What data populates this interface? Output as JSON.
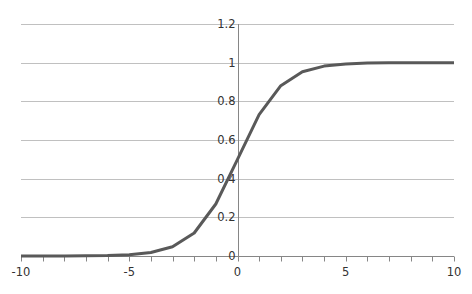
{
  "chart_data": {
    "type": "line",
    "title": "",
    "xlabel": "",
    "ylabel": "",
    "x": [
      -10,
      -9,
      -8,
      -7,
      -6,
      -5,
      -4,
      -3,
      -2,
      -1,
      0,
      1,
      2,
      3,
      4,
      5,
      6,
      7,
      8,
      9,
      10
    ],
    "series": [
      {
        "name": "sigmoid",
        "values": [
          4.54e-05,
          0.000123,
          0.000335,
          0.000911,
          0.00247,
          0.00669,
          0.018,
          0.0474,
          0.1192,
          0.2689,
          0.5,
          0.7311,
          0.8808,
          0.9526,
          0.982,
          0.9933,
          0.9975,
          0.9991,
          0.9997,
          0.9999,
          1.0
        ]
      }
    ],
    "xlim": [
      -10,
      10
    ],
    "ylim": [
      0,
      1.2
    ],
    "x_ticks": [
      "-10",
      "-5",
      "0",
      "5",
      "10"
    ],
    "y_ticks": [
      "0",
      "0.2",
      "0.4",
      "0.6",
      "0.8",
      "1",
      "1.2"
    ],
    "grid": {
      "horizontal": true,
      "vertical": false
    },
    "legend": null,
    "colors": {
      "line": "#595959",
      "grid": "#c0c0c0",
      "axis": "#868686"
    }
  }
}
